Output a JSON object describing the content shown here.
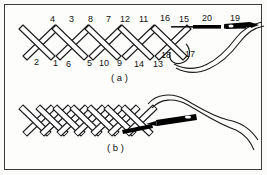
{
  "figure": {
    "background_color": "#fdfdfc",
    "border_color": "#3a3a3a",
    "ink_color": "#1a1a1a",
    "needle_color": "#000000"
  },
  "panels": [
    {
      "id": "a",
      "label": "( a )",
      "description": "Row of open cross stitches with numbered needle entry and exit points, needle and thread at right",
      "top_numbers": [
        "4",
        "3",
        "8",
        "7",
        "12",
        "11",
        "16",
        "15",
        "20",
        "19"
      ],
      "bottom_numbers": [
        "2",
        "1",
        "6",
        "5",
        "10",
        "9",
        "14",
        "13",
        "18",
        "17"
      ],
      "stitch_count": 5,
      "has_needle": true,
      "has_thread_loop": true
    },
    {
      "id": "b",
      "label": "( b )",
      "description": "Dense braided cross stitch band with horizontal needle and thread at right",
      "top_numbers": [],
      "bottom_numbers": [],
      "stitch_count": 7,
      "has_needle": true,
      "has_thread_loop": true
    }
  ],
  "number_positions": {
    "panel_a_top": [
      {
        "label": "4",
        "x": 50,
        "y": 15
      },
      {
        "label": "3",
        "x": 69,
        "y": 15
      },
      {
        "label": "8",
        "x": 88,
        "y": 15
      },
      {
        "label": "7",
        "x": 106,
        "y": 15
      },
      {
        "label": "12",
        "x": 121,
        "y": 15
      },
      {
        "label": "11",
        "x": 140,
        "y": 15
      },
      {
        "label": "16",
        "x": 161,
        "y": 14
      },
      {
        "label": "15",
        "x": 180,
        "y": 15
      },
      {
        "label": "20",
        "x": 203,
        "y": 14
      },
      {
        "label": "19",
        "x": 231,
        "y": 14
      }
    ],
    "panel_a_bottom": [
      {
        "label": "2",
        "x": 34,
        "y": 58
      },
      {
        "label": "1",
        "x": 53,
        "y": 59
      },
      {
        "label": "6",
        "x": 66,
        "y": 60
      },
      {
        "label": "5",
        "x": 87,
        "y": 59
      },
      {
        "label": "10",
        "x": 100,
        "y": 59
      },
      {
        "label": "9",
        "x": 117,
        "y": 59
      },
      {
        "label": "14",
        "x": 135,
        "y": 60
      },
      {
        "label": "13",
        "x": 154,
        "y": 60
      },
      {
        "label": "18",
        "x": 162,
        "y": 52
      },
      {
        "label": "17",
        "x": 186,
        "y": 51
      }
    ]
  },
  "labels": {
    "panel_a": "( a )",
    "panel_b": "( b )"
  }
}
